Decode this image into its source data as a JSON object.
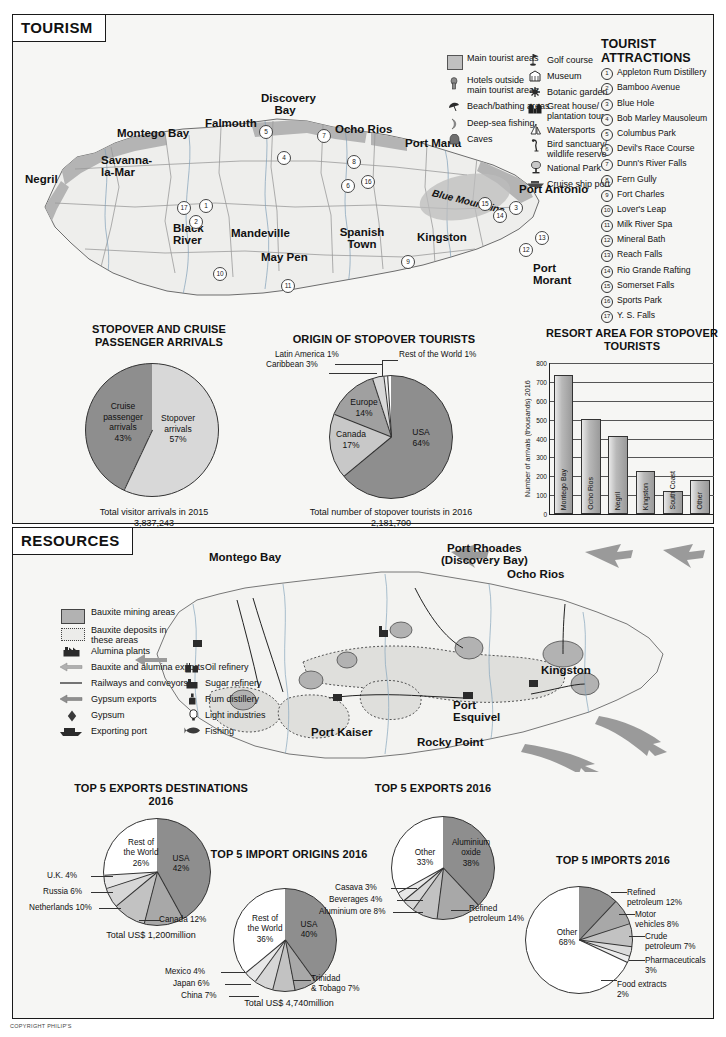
{
  "copyright": "COPYRIGHT PHILIP'S",
  "tourism": {
    "panel_title": "TOURISM",
    "legend_left": [
      {
        "icon": "filled-square-swatch",
        "label": "Main tourist areas"
      },
      {
        "icon": "hotel-icon",
        "label": "Hotels outside main tourist areas"
      },
      {
        "icon": "beach-umbrella-icon",
        "label": "Beach/bathing areas"
      },
      {
        "icon": "deep-sea-fishing-icon",
        "label": "Deep-sea fishing"
      },
      {
        "icon": "cave-icon",
        "label": "Caves"
      }
    ],
    "legend_right": [
      {
        "icon": "golf-flag-icon",
        "label": "Golf course"
      },
      {
        "icon": "museum-icon",
        "label": "Museum"
      },
      {
        "icon": "botanic-garden-icon",
        "label": "Botanic garden"
      },
      {
        "icon": "great-house-icon",
        "label": "Great house/ plantation tour"
      },
      {
        "icon": "watersports-sailboat-icon",
        "label": "Watersports"
      },
      {
        "icon": "bird-sanctuary-icon",
        "label": "Bird sanctuary/ wildlife reserve"
      },
      {
        "icon": "national-park-icon",
        "label": "National Park"
      },
      {
        "icon": "cruise-ship-icon",
        "label": "Cruise ship port"
      }
    ],
    "attractions_heading_line1": "TOURIST",
    "attractions_heading_line2": "ATTRACTIONS",
    "attractions": [
      {
        "num": "1",
        "label": "Appleton Rum Distillery"
      },
      {
        "num": "2",
        "label": "Bamboo Avenue"
      },
      {
        "num": "3",
        "label": "Blue Hole"
      },
      {
        "num": "4",
        "label": "Bob Marley Mausoleum"
      },
      {
        "num": "5",
        "label": "Columbus Park"
      },
      {
        "num": "6",
        "label": "Devil's Race Course"
      },
      {
        "num": "7",
        "label": "Dunn's River Falls"
      },
      {
        "num": "8",
        "label": "Fern Gully"
      },
      {
        "num": "9",
        "label": "Fort Charles"
      },
      {
        "num": "10",
        "label": "Lover's Leap"
      },
      {
        "num": "11",
        "label": "Milk River Spa"
      },
      {
        "num": "12",
        "label": "Mineral Bath"
      },
      {
        "num": "13",
        "label": "Reach Falls"
      },
      {
        "num": "14",
        "label": "Rio Grande Rafting"
      },
      {
        "num": "15",
        "label": "Somerset Falls"
      },
      {
        "num": "16",
        "label": "Sports Park"
      },
      {
        "num": "17",
        "label": "Y. S. Falls"
      }
    ],
    "map_places": [
      {
        "name": "Montego Bay",
        "x": 112,
        "y": 116
      },
      {
        "name": "Falmouth",
        "x": 199,
        "y": 116
      },
      {
        "name": "Discovery Bay",
        "x": 258,
        "y": 96
      },
      {
        "name": "Ocho Rios",
        "x": 330,
        "y": 122
      },
      {
        "name": "Port Maria",
        "x": 392,
        "y": 135
      },
      {
        "name": "Port Antonio",
        "x": 498,
        "y": 182
      },
      {
        "name": "Negril",
        "x": 22,
        "y": 174
      },
      {
        "name": "Savanna-la-Mar",
        "x": 98,
        "y": 163
      },
      {
        "name": "Black River",
        "x": 165,
        "y": 224
      },
      {
        "name": "Mandeville",
        "x": 222,
        "y": 228
      },
      {
        "name": "May Pen",
        "x": 262,
        "y": 250
      },
      {
        "name": "Spanish Town",
        "x": 333,
        "y": 226
      },
      {
        "name": "Kingston",
        "x": 410,
        "y": 229
      },
      {
        "name": "Port Morant",
        "x": 526,
        "y": 262
      },
      {
        "name": "Blue Mountains",
        "x": 424,
        "y": 197
      }
    ],
    "map_markers": [
      "1",
      "2",
      "3",
      "4",
      "5",
      "6",
      "7",
      "8",
      "9",
      "10",
      "11",
      "12",
      "13",
      "14",
      "15",
      "16",
      "17"
    ]
  },
  "resources": {
    "panel_title": "RESOURCES",
    "legend_left": [
      {
        "icon": "bauxite-mining-swatch",
        "label": "Bauxite mining areas"
      },
      {
        "icon": "bauxite-deposits-swatch",
        "label": "Bauxite deposits in these areas"
      },
      {
        "icon": "alumina-plant-icon",
        "label": "Alumina plants"
      },
      {
        "icon": "bauxite-export-arrow-icon",
        "label": "Bauxite and alumina exports"
      },
      {
        "icon": "railway-line-icon",
        "label": "Railways and conveyors"
      },
      {
        "icon": "gypsum-export-arrow-icon",
        "label": "Gypsum exports"
      },
      {
        "icon": "gypsum-diamond-icon",
        "label": "Gypsum"
      },
      {
        "icon": "exporting-port-icon",
        "label": "Exporting port"
      }
    ],
    "legend_right": [
      {
        "icon": "oil-refinery-icon",
        "label": "Oil refinery"
      },
      {
        "icon": "sugar-refinery-icon",
        "label": "Sugar refinery"
      },
      {
        "icon": "rum-distillery-icon",
        "label": "Rum distillery"
      },
      {
        "icon": "light-industries-icon",
        "label": "Light industries"
      },
      {
        "icon": "fishing-icon",
        "label": "Fishing"
      }
    ],
    "map_places": [
      {
        "name": "Montego Bay",
        "x": 60,
        "y": 28
      },
      {
        "name": "Port Rhoades",
        "x": 278,
        "y": 18
      },
      {
        "name": "(Discovery Bay)",
        "x": 272,
        "y": 30
      },
      {
        "name": "Ocho Rios",
        "x": 336,
        "y": 38
      },
      {
        "name": "Kingston",
        "x": 382,
        "y": 138
      },
      {
        "name": "Port Esquivel",
        "x": 295,
        "y": 172
      },
      {
        "name": "Rocky Point",
        "x": 248,
        "y": 205
      },
      {
        "name": "Port Kaiser",
        "x": 148,
        "y": 192
      }
    ]
  },
  "chart_data": [
    {
      "id": "stopover-cruise-pie",
      "type": "pie",
      "title": "STOPOVER AND CRUISE PASSENGER ARRIVALS",
      "labels": [
        "Stopover arrivals",
        "Cruise passenger arrivals"
      ],
      "values": [
        57,
        43
      ],
      "value_suffix": "%",
      "colors": [
        "#d8d8d8",
        "#8e8e8e"
      ],
      "footnote_line1": "Total visitor arrivals in 2015",
      "footnote_line2": "3,837,243"
    },
    {
      "id": "origin-stopover-pie",
      "type": "pie",
      "title": "ORIGIN OF STOPOVER TOURISTS",
      "labels": [
        "USA",
        "Canada",
        "Europe",
        "Caribbean",
        "Latin America",
        "Rest of the World"
      ],
      "values": [
        64,
        17,
        14,
        3,
        1,
        1
      ],
      "value_suffix": "%",
      "colors": [
        "#8e8e8e",
        "#c8c8c8",
        "#a0a0a0",
        "#d8d8d8",
        "#efefef",
        "#ffffff"
      ],
      "footnote_line1": "Total number of stopover tourists in 2016",
      "footnote_line2": "2,181,700"
    },
    {
      "id": "resort-area-bar",
      "type": "bar",
      "title": "RESORT AREA FOR STOPOVER TOURISTS",
      "categories": [
        "Montego Bay",
        "Ocho Rios",
        "Negril",
        "Kingston",
        "South Coast",
        "Other"
      ],
      "values": [
        735,
        505,
        412,
        228,
        122,
        180
      ],
      "ylabel": "Number of arrivals (thousands) 2016",
      "xlabel": "",
      "ylim": [
        0,
        800
      ],
      "yticks": [
        0,
        100,
        200,
        300,
        400,
        500,
        600,
        700,
        800
      ],
      "grid": true,
      "legend": "none"
    },
    {
      "id": "exports-destinations-pie",
      "type": "pie",
      "title": "TOP 5 EXPORTS DESTINATIONS 2016",
      "labels": [
        "USA",
        "Canada",
        "Netherlands",
        "Russia",
        "U.K.",
        "Rest of the World"
      ],
      "values": [
        42,
        12,
        10,
        6,
        4,
        26
      ],
      "value_suffix": "%",
      "colors": [
        "#8e8e8e",
        "#a8a8a8",
        "#c2c2c2",
        "#d6d6d6",
        "#e8e8e8",
        "#ffffff"
      ],
      "footnote_line1": "Total US$ 1,200million",
      "footnote_line2": ""
    },
    {
      "id": "import-origins-pie",
      "type": "pie",
      "title": "TOP 5 IMPORT ORIGINS 2016",
      "labels": [
        "USA",
        "Trinidad & Tobago",
        "China",
        "Japan",
        "Mexico",
        "Rest of the World"
      ],
      "values": [
        40,
        7,
        7,
        6,
        4,
        36
      ],
      "value_suffix": "%",
      "colors": [
        "#8e8e8e",
        "#a8a8a8",
        "#c2c2c2",
        "#d6d6d6",
        "#e8e8e8",
        "#ffffff"
      ],
      "footnote_line1": "Total US$ 4,740million",
      "footnote_line2": ""
    },
    {
      "id": "exports-pie",
      "type": "pie",
      "title": "TOP 5 EXPORTS 2016",
      "labels": [
        "Aluminium oxide",
        "Refined petroleum",
        "Aluminium ore",
        "Beverages",
        "Casava",
        "Other"
      ],
      "values": [
        38,
        14,
        8,
        4,
        3,
        33
      ],
      "value_suffix": "%",
      "colors": [
        "#8e8e8e",
        "#a8a8a8",
        "#c2c2c2",
        "#d6d6d6",
        "#e8e8e8",
        "#ffffff"
      ],
      "footnote_line1": "",
      "footnote_line2": ""
    },
    {
      "id": "imports-pie",
      "type": "pie",
      "title": "TOP 5 IMPORTS 2016",
      "labels": [
        "Refined petroleum",
        "Motor vehicles",
        "Crude petroleum",
        "Pharmaceuticals",
        "Food extracts",
        "Other"
      ],
      "values": [
        12,
        8,
        7,
        3,
        2,
        68
      ],
      "value_suffix": "%",
      "colors": [
        "#8e8e8e",
        "#a8a8a8",
        "#c2c2c2",
        "#dcdcdc",
        "#eeeeee",
        "#ffffff"
      ],
      "footnote_line1": "",
      "footnote_line2": ""
    }
  ],
  "pie_labels": {
    "p1_a": "Stopover\narrivals\n57%",
    "p1_b": "Cruise\npassenger\narrivals\n43%",
    "p2_usa": "USA\n64%",
    "p2_canada": "Canada\n17%",
    "p2_europe": "Europe\n14%",
    "p2_carib": "Caribbean 3%",
    "p2_latin": "Latin America 1%",
    "p2_rest": "Rest of the World 1%",
    "p4_usa": "USA\n42%",
    "p4_rest": "Rest of\nthe World\n26%",
    "p4_uk": "U.K. 4%",
    "p4_russia": "Russia 6%",
    "p4_neth": "Netherlands 10%",
    "p4_canada": "Canada 12%",
    "p5_usa": "USA\n40%",
    "p5_rest": "Rest of\nthe World\n36%",
    "p5_mexico": "Mexico 4%",
    "p5_japan": "Japan 6%",
    "p5_china": "China 7%",
    "p5_tt": "Trinidad\n& Tobago 7%",
    "p6_alox": "Aluminium\noxide\n38%",
    "p6_other": "Other\n33%",
    "p6_casava": "Casava 3%",
    "p6_bev": "Beverages 4%",
    "p6_alore": "Aluminium ore 8%",
    "p6_refpet": "Refined\npetroleum 14%",
    "p7_other": "Other\n68%",
    "p7_refpet": "Refined\npetroleum 12%",
    "p7_motor": "Motor\nvehicles 8%",
    "p7_crude": "Crude\npetroleum 7%",
    "p7_pharma": "Pharmaceuticals\n3%",
    "p7_food": "Food extracts\n2%"
  }
}
